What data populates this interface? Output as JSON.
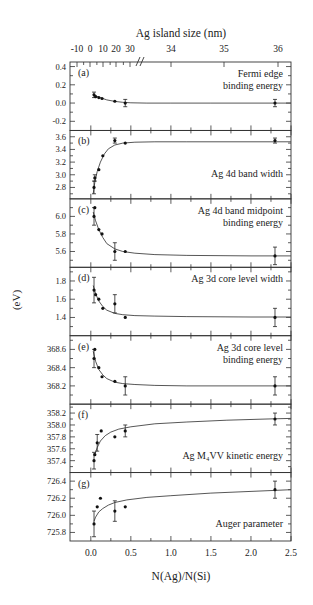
{
  "figure": {
    "top_axis_title": "Ag island size (nm)",
    "bottom_axis_title": "N(Ag)/N(Si)",
    "y_axis_title": "(eV)"
  },
  "chart_data": {
    "type": "scatter",
    "layout": "7 vertically stacked panels sharing x-axis",
    "x": {
      "label": "N(Ag)/N(Si)",
      "range": [
        -0.26,
        2.5
      ],
      "ticks": [
        0.0,
        0.5,
        1.0,
        1.5,
        2.0,
        2.5
      ],
      "tick_labels": [
        "0.0",
        "0.5",
        "1.0",
        "1.5",
        "2.0",
        "2.5"
      ]
    },
    "top_axis": {
      "label": "Ag island size (nm)",
      "tick_labels": [
        "-10",
        "0",
        "10",
        "20",
        "30",
        "34",
        "35",
        "36"
      ],
      "axis_break_after": "30"
    },
    "y_label": "(eV)",
    "panels": [
      {
        "id": "a",
        "tag": "(a)",
        "label_lines": [
          "Fermi edge",
          "binding energy"
        ],
        "ylim": [
          -0.3,
          0.45
        ],
        "ticks": [
          -0.2,
          0.0,
          0.2,
          0.4
        ],
        "tick_labels": [
          "-0.2",
          "0.0",
          "0.2",
          "0.4"
        ],
        "points": [
          {
            "x": 0.04,
            "y": 0.09,
            "err": 0.03
          },
          {
            "x": 0.06,
            "y": 0.07
          },
          {
            "x": 0.1,
            "y": 0.06
          },
          {
            "x": 0.14,
            "y": 0.05
          },
          {
            "x": 0.3,
            "y": 0.02
          },
          {
            "x": 0.43,
            "y": 0.0,
            "err": 0.04
          },
          {
            "x": 2.3,
            "y": 0.0,
            "err": 0.04
          }
        ],
        "fit": [
          [
            0.03,
            0.1
          ],
          [
            0.06,
            0.08
          ],
          [
            0.1,
            0.065
          ],
          [
            0.15,
            0.05
          ],
          [
            0.2,
            0.035
          ],
          [
            0.3,
            0.018
          ],
          [
            0.4,
            0.008
          ],
          [
            0.5,
            0.003
          ],
          [
            0.7,
            0.0
          ],
          [
            1.0,
            0.0
          ],
          [
            1.5,
            0.0
          ],
          [
            2.0,
            0.0
          ],
          [
            2.5,
            0.0
          ]
        ]
      },
      {
        "id": "b",
        "tag": "(b)",
        "label_lines": [
          "Ag 4d band width"
        ],
        "ylim": [
          2.62,
          3.7
        ],
        "ticks": [
          2.8,
          3.0,
          3.2,
          3.4,
          3.6
        ],
        "tick_labels": [
          "2.8",
          "3.0",
          "3.2",
          "3.4",
          "3.6"
        ],
        "points": [
          {
            "x": 0.04,
            "y": 2.8,
            "err": 0.1
          },
          {
            "x": 0.05,
            "y": 2.95,
            "err": 0.05
          },
          {
            "x": 0.1,
            "y": 3.08
          },
          {
            "x": 0.15,
            "y": 3.3
          },
          {
            "x": 0.3,
            "y": 3.54,
            "err": 0.04
          },
          {
            "x": 0.43,
            "y": 3.5
          },
          {
            "x": 2.3,
            "y": 3.54,
            "err": 0.04
          }
        ],
        "fit": [
          [
            0.03,
            2.7
          ],
          [
            0.05,
            2.88
          ],
          [
            0.08,
            3.05
          ],
          [
            0.12,
            3.2
          ],
          [
            0.17,
            3.33
          ],
          [
            0.22,
            3.41
          ],
          [
            0.3,
            3.47
          ],
          [
            0.4,
            3.5
          ],
          [
            0.55,
            3.515
          ],
          [
            0.8,
            3.52
          ],
          [
            1.2,
            3.52
          ],
          [
            2.0,
            3.52
          ],
          [
            2.5,
            3.52
          ]
        ]
      },
      {
        "id": "c",
        "tag": "(c)",
        "label_lines": [
          "Ag 4d band midpoint",
          "binding energy"
        ],
        "ylim": [
          5.42,
          6.2
        ],
        "ticks": [
          5.6,
          5.8,
          6.0
        ],
        "tick_labels": [
          "5.6",
          "5.8",
          "6.0"
        ],
        "points": [
          {
            "x": 0.04,
            "y": 6.0,
            "err": 0.1
          },
          {
            "x": 0.05,
            "y": 6.1
          },
          {
            "x": 0.1,
            "y": 5.85
          },
          {
            "x": 0.14,
            "y": 5.8
          },
          {
            "x": 0.3,
            "y": 5.6,
            "err": 0.1
          },
          {
            "x": 0.43,
            "y": 5.6
          },
          {
            "x": 2.3,
            "y": 5.55,
            "err": 0.1
          }
        ],
        "fit": [
          [
            0.03,
            6.05
          ],
          [
            0.06,
            5.95
          ],
          [
            0.1,
            5.85
          ],
          [
            0.15,
            5.76
          ],
          [
            0.2,
            5.69
          ],
          [
            0.3,
            5.63
          ],
          [
            0.4,
            5.6
          ],
          [
            0.55,
            5.58
          ],
          [
            0.8,
            5.565
          ],
          [
            1.2,
            5.555
          ],
          [
            2.0,
            5.55
          ],
          [
            2.5,
            5.55
          ]
        ]
      },
      {
        "id": "d",
        "tag": "(d)",
        "label_lines": [
          "Ag 3d core level width"
        ],
        "ylim": [
          1.2,
          1.95
        ],
        "ticks": [
          1.4,
          1.6,
          1.8
        ],
        "tick_labels": [
          "1.4",
          "1.6",
          "1.8"
        ],
        "points": [
          {
            "x": 0.04,
            "y": 1.7,
            "err": 0.14
          },
          {
            "x": 0.06,
            "y": 1.65
          },
          {
            "x": 0.1,
            "y": 1.6
          },
          {
            "x": 0.15,
            "y": 1.5
          },
          {
            "x": 0.3,
            "y": 1.55,
            "err": 0.1
          },
          {
            "x": 0.43,
            "y": 1.4
          },
          {
            "x": 2.3,
            "y": 1.4,
            "err": 0.1
          }
        ],
        "fit": [
          [
            0.03,
            1.75
          ],
          [
            0.06,
            1.66
          ],
          [
            0.1,
            1.58
          ],
          [
            0.15,
            1.52
          ],
          [
            0.2,
            1.48
          ],
          [
            0.3,
            1.445
          ],
          [
            0.4,
            1.43
          ],
          [
            0.55,
            1.42
          ],
          [
            0.8,
            1.415
          ],
          [
            1.2,
            1.41
          ],
          [
            2.0,
            1.405
          ],
          [
            2.5,
            1.405
          ]
        ]
      },
      {
        "id": "e",
        "tag": "(e)",
        "label_lines": [
          "Ag 3d core level",
          "binding energy"
        ],
        "ylim": [
          368.0,
          368.75
        ],
        "ticks": [
          368.2,
          368.4,
          368.6
        ],
        "tick_labels": [
          "368.2",
          "368.4",
          "368.6"
        ],
        "points": [
          {
            "x": 0.04,
            "y": 368.5,
            "err": 0.1
          },
          {
            "x": 0.05,
            "y": 368.6
          },
          {
            "x": 0.1,
            "y": 368.4
          },
          {
            "x": 0.14,
            "y": 368.3
          },
          {
            "x": 0.3,
            "y": 368.25
          },
          {
            "x": 0.43,
            "y": 368.2,
            "err": 0.1
          },
          {
            "x": 2.3,
            "y": 368.2,
            "err": 0.1
          }
        ],
        "fit": [
          [
            0.03,
            368.58
          ],
          [
            0.06,
            368.47
          ],
          [
            0.1,
            368.38
          ],
          [
            0.15,
            368.32
          ],
          [
            0.2,
            368.28
          ],
          [
            0.3,
            368.24
          ],
          [
            0.4,
            368.225
          ],
          [
            0.55,
            368.215
          ],
          [
            0.8,
            368.205
          ],
          [
            1.2,
            368.2
          ],
          [
            2.0,
            368.2
          ],
          [
            2.5,
            368.2
          ]
        ]
      },
      {
        "id": "f",
        "tag": "(f)",
        "label_lines": [
          "Ag M₄VV kinetic energy"
        ],
        "ylim": [
          357.2,
          358.35
        ],
        "ticks": [
          357.4,
          357.6,
          357.8,
          358.0,
          358.2
        ],
        "tick_labels": [
          "357.4",
          "357.6",
          "357.8",
          "358.0",
          "358.2"
        ],
        "points": [
          {
            "x": 0.04,
            "y": 357.4,
            "err": 0.14
          },
          {
            "x": 0.05,
            "y": 357.5
          },
          {
            "x": 0.08,
            "y": 357.7,
            "err": 0.14
          },
          {
            "x": 0.13,
            "y": 357.9
          },
          {
            "x": 0.3,
            "y": 357.8
          },
          {
            "x": 0.43,
            "y": 357.9,
            "err": 0.1
          },
          {
            "x": 2.3,
            "y": 358.1,
            "err": 0.1
          }
        ],
        "fit": [
          [
            0.05,
            357.5
          ],
          [
            0.08,
            357.62
          ],
          [
            0.12,
            357.73
          ],
          [
            0.18,
            357.82
          ],
          [
            0.25,
            357.88
          ],
          [
            0.35,
            357.93
          ],
          [
            0.5,
            357.97
          ],
          [
            0.8,
            358.02
          ],
          [
            1.2,
            358.05
          ],
          [
            1.7,
            358.08
          ],
          [
            2.2,
            358.1
          ],
          [
            2.5,
            358.11
          ]
        ]
      },
      {
        "id": "g",
        "tag": "(g)",
        "label_lines": [
          "Auger parameter"
        ],
        "ylim": [
          725.7,
          726.5
        ],
        "ticks": [
          725.8,
          726.0,
          726.2,
          726.4
        ],
        "tick_labels": [
          "725.8",
          "726.0",
          "726.2",
          "726.4"
        ],
        "points": [
          {
            "x": 0.04,
            "y": 725.9,
            "err": 0.15
          },
          {
            "x": 0.08,
            "y": 726.1
          },
          {
            "x": 0.12,
            "y": 726.2
          },
          {
            "x": 0.3,
            "y": 726.05,
            "err": 0.12
          },
          {
            "x": 0.43,
            "y": 726.1
          },
          {
            "x": 2.3,
            "y": 726.3,
            "err": 0.1
          }
        ],
        "fit": [
          [
            0.04,
            725.93
          ],
          [
            0.06,
            725.98
          ],
          [
            0.1,
            726.04
          ],
          [
            0.15,
            726.08
          ],
          [
            0.22,
            726.12
          ],
          [
            0.3,
            726.15
          ],
          [
            0.45,
            726.18
          ],
          [
            0.7,
            726.21
          ],
          [
            1.0,
            726.23
          ],
          [
            1.5,
            726.26
          ],
          [
            2.0,
            726.28
          ],
          [
            2.5,
            726.3
          ]
        ]
      }
    ]
  }
}
